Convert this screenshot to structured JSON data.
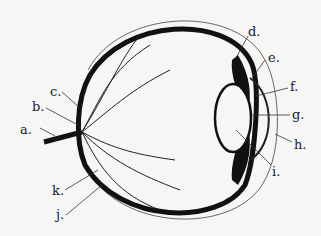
{
  "diagram": {
    "labels": [
      {
        "id": "a",
        "text": "a."
      },
      {
        "id": "b",
        "text": "b."
      },
      {
        "id": "c",
        "text": "c."
      },
      {
        "id": "d",
        "text": "d."
      },
      {
        "id": "e",
        "text": "e."
      },
      {
        "id": "f",
        "text": "f."
      },
      {
        "id": "g",
        "text": "g."
      },
      {
        "id": "h",
        "text": "h."
      },
      {
        "id": "i",
        "text": "i."
      },
      {
        "id": "j",
        "text": "j."
      },
      {
        "id": "k",
        "text": "k."
      }
    ],
    "colors": {
      "ink": "#1a1a1a",
      "paper": "#f6f6f4"
    }
  }
}
